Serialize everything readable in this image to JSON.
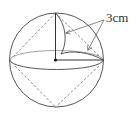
{
  "diagram": {
    "type": "geometry-figure",
    "label": "3cm",
    "colors": {
      "stroke": "#444444",
      "dashed": "#777777",
      "background": "#ffffff"
    },
    "sphere": {
      "cx": 56.5,
      "cy": 60,
      "r": 47
    },
    "equator": {
      "cx": 56.5,
      "cy": 60,
      "rx": 46.5,
      "ry": 9.5
    },
    "points": {
      "top": [
        55.5,
        13
      ],
      "bottom": [
        55.5,
        107
      ],
      "left": [
        10,
        60
      ],
      "right": [
        103,
        60
      ],
      "center": [
        55.5,
        60
      ]
    },
    "arrows": [
      {
        "from": [
          104,
          20
        ],
        "to": [
          65,
          33
        ]
      },
      {
        "from": [
          104,
          20
        ],
        "to": [
          88,
          50
        ]
      }
    ]
  }
}
